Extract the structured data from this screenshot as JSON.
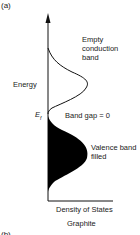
{
  "panel_label_a": "(a)",
  "panel_label_b": "(b)",
  "y_axis_label": "Energy",
  "x_axis_label": "Density of States",
  "material": "Graphite",
  "fermi_label": "E",
  "fermi_subscript": "f",
  "annotations": {
    "conduction_line1": "Empty",
    "conduction_line2": "conduction",
    "conduction_line3": "band",
    "band_gap": "Band gap = 0",
    "valence_line1": "Valence band",
    "valence_line2": "filled"
  },
  "colors": {
    "line": "#111111",
    "fill": "#000000",
    "text": "#222222"
  }
}
